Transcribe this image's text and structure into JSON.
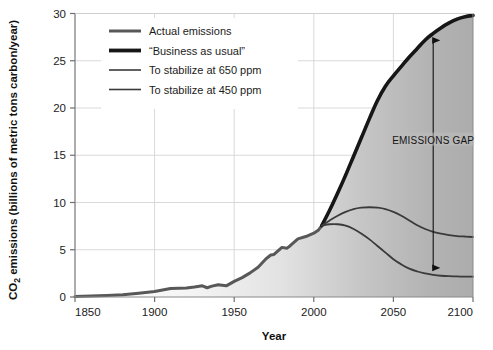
{
  "chart_data": {
    "type": "line",
    "title": "",
    "xlabel": "Year",
    "ylabel": "CO2 emissions (billions of metric tons carbon/year)",
    "ylabel_parts": {
      "prefix": "CO",
      "subscript": "2",
      "suffix": " emissions (billions of metric tons carbon/year)"
    },
    "xlim": [
      1850,
      2100
    ],
    "ylim": [
      0,
      30
    ],
    "xticks": [
      1850,
      1900,
      1950,
      2000,
      2050,
      2100
    ],
    "yticks": [
      0,
      5,
      10,
      15,
      20,
      25,
      30
    ],
    "xtick_labels": [
      "1850",
      "1900",
      "1950",
      "2000",
      "2050",
      "2100"
    ],
    "ytick_labels": [
      "0",
      "5",
      "10",
      "15",
      "20",
      "25",
      "30"
    ],
    "grid": true,
    "grid_color": "#d9d9d9",
    "legend_position": "top-left-inside",
    "area_fill": "gradient white-to-gray under business-as-usual curve",
    "series": [
      {
        "name": "Actual emissions",
        "color": "#585858",
        "width": 3.0,
        "points": [
          [
            1850,
            0.06
          ],
          [
            1860,
            0.11
          ],
          [
            1870,
            0.17
          ],
          [
            1880,
            0.25
          ],
          [
            1890,
            0.4
          ],
          [
            1900,
            0.58
          ],
          [
            1910,
            0.9
          ],
          [
            1920,
            0.95
          ],
          [
            1925,
            1.05
          ],
          [
            1930,
            1.18
          ],
          [
            1933,
            0.98
          ],
          [
            1936,
            1.15
          ],
          [
            1940,
            1.3
          ],
          [
            1945,
            1.18
          ],
          [
            1950,
            1.65
          ],
          [
            1955,
            2.05
          ],
          [
            1960,
            2.55
          ],
          [
            1965,
            3.15
          ],
          [
            1970,
            4.05
          ],
          [
            1973,
            4.45
          ],
          [
            1975,
            4.5
          ],
          [
            1980,
            5.25
          ],
          [
            1983,
            5.15
          ],
          [
            1985,
            5.4
          ],
          [
            1990,
            6.15
          ],
          [
            1995,
            6.4
          ],
          [
            2000,
            6.75
          ],
          [
            2003,
            7.1
          ],
          [
            2005,
            7.55
          ]
        ]
      },
      {
        "name": "“Business as usual”",
        "color": "#161616",
        "width": 3.6,
        "points": [
          [
            2005,
            7.55
          ],
          [
            2010,
            9.2
          ],
          [
            2015,
            11.0
          ],
          [
            2020,
            12.9
          ],
          [
            2025,
            14.9
          ],
          [
            2030,
            16.9
          ],
          [
            2035,
            18.9
          ],
          [
            2040,
            20.8
          ],
          [
            2045,
            22.3
          ],
          [
            2050,
            23.4
          ],
          [
            2055,
            24.4
          ],
          [
            2060,
            25.4
          ],
          [
            2065,
            26.3
          ],
          [
            2070,
            27.2
          ],
          [
            2075,
            27.9
          ],
          [
            2080,
            28.5
          ],
          [
            2085,
            29.0
          ],
          [
            2090,
            29.4
          ],
          [
            2095,
            29.65
          ],
          [
            2100,
            29.8
          ]
        ]
      },
      {
        "name": "To stabilize at 650 ppm",
        "color": "#3a3a3a",
        "width": 1.8,
        "points": [
          [
            2005,
            7.55
          ],
          [
            2010,
            8.1
          ],
          [
            2015,
            8.6
          ],
          [
            2020,
            9.0
          ],
          [
            2025,
            9.3
          ],
          [
            2030,
            9.45
          ],
          [
            2035,
            9.5
          ],
          [
            2040,
            9.45
          ],
          [
            2045,
            9.3
          ],
          [
            2050,
            9.0
          ],
          [
            2055,
            8.6
          ],
          [
            2060,
            8.1
          ],
          [
            2065,
            7.6
          ],
          [
            2070,
            7.2
          ],
          [
            2075,
            6.9
          ],
          [
            2080,
            6.7
          ],
          [
            2085,
            6.55
          ],
          [
            2090,
            6.45
          ],
          [
            2095,
            6.4
          ],
          [
            2100,
            6.35
          ]
        ]
      },
      {
        "name": "To stabilize at 450 ppm",
        "color": "#3a3a3a",
        "width": 1.8,
        "points": [
          [
            2005,
            7.55
          ],
          [
            2010,
            7.7
          ],
          [
            2015,
            7.7
          ],
          [
            2020,
            7.55
          ],
          [
            2025,
            7.2
          ],
          [
            2030,
            6.7
          ],
          [
            2035,
            6.1
          ],
          [
            2040,
            5.4
          ],
          [
            2045,
            4.7
          ],
          [
            2050,
            4.0
          ],
          [
            2055,
            3.45
          ],
          [
            2060,
            3.0
          ],
          [
            2065,
            2.7
          ],
          [
            2070,
            2.5
          ],
          [
            2075,
            2.35
          ],
          [
            2080,
            2.25
          ],
          [
            2085,
            2.2
          ],
          [
            2090,
            2.18
          ],
          [
            2095,
            2.15
          ],
          [
            2100,
            2.15
          ]
        ]
      }
    ],
    "annotations": [
      {
        "name": "emissions-gap",
        "text": "EMISSIONS GAP",
        "x": 2075,
        "y_top": 27.9,
        "y_bottom": 2.35,
        "label_y": 16.6,
        "arrow": "double-headed"
      }
    ]
  },
  "legend": {
    "items": [
      {
        "label": "Actual emissions",
        "swatch": "line-swatch-actual"
      },
      {
        "label": "“Business as usual”",
        "swatch": "line-swatch-bau"
      },
      {
        "label": "To stabilize at 650 ppm",
        "swatch": "line-swatch-650"
      },
      {
        "label": "To stabilize at 450 ppm",
        "swatch": "line-swatch-450"
      }
    ]
  },
  "colors": {
    "actual": "#585858",
    "business_as_usual": "#161616",
    "stabilize": "#3a3a3a",
    "grid": "#d9d9d9",
    "axis": "#7a7a7a",
    "text": "#1c1c1c"
  }
}
